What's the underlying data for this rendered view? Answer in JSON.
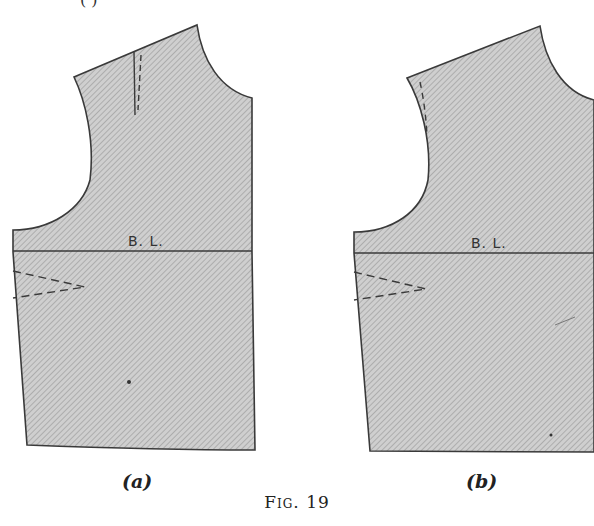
{
  "figure": {
    "caption": "Fig. 19",
    "top_fragment": "( )",
    "panels": [
      {
        "id": "a",
        "label": "(a)",
        "line_label": "B. L.",
        "markings": [
          "shoulder dart",
          "underarm dart",
          "breast line",
          "center dot"
        ]
      },
      {
        "id": "b",
        "label": "(b)",
        "line_label": "B. L.",
        "markings": [
          "armhole dart (dashed)",
          "underarm dart",
          "breast line"
        ]
      }
    ]
  },
  "colors": {
    "fill": "#c9c9c9",
    "hatch": "#9a9a9a",
    "outline": "#3a3a3a",
    "background": "#ffffff"
  }
}
